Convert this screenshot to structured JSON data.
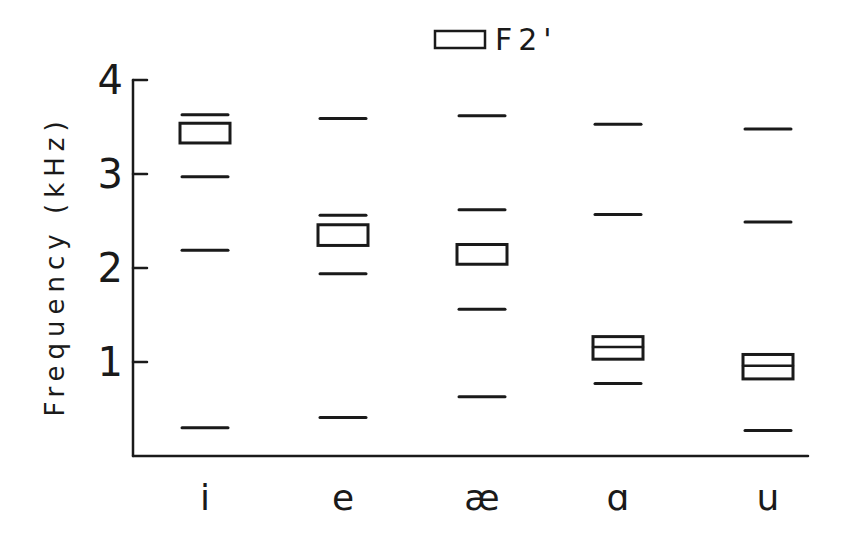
{
  "chart_data": {
    "type": "scatter",
    "title": "",
    "xlabel": "",
    "ylabel": "Frequency (kHz)",
    "ylim": [
      0,
      4
    ],
    "yticks": [
      "1",
      "2",
      "3",
      "4"
    ],
    "grid": false,
    "legend": {
      "position": "top-center",
      "entries": [
        {
          "symbol": "box",
          "label": "F2'"
        }
      ]
    },
    "categories": [
      "i",
      "e",
      "æ",
      "ɑ",
      "u"
    ],
    "series": [
      {
        "name": "formant-lines",
        "marker": "dash",
        "values": [
          [
            0.3,
            2.19,
            2.97,
            3.63
          ],
          [
            0.41,
            1.94,
            2.56,
            3.59
          ],
          [
            0.63,
            1.56,
            2.62,
            3.62
          ],
          [
            0.77,
            2.57,
            3.53
          ],
          [
            0.27,
            2.49,
            3.48
          ]
        ]
      },
      {
        "name": "F2'",
        "marker": "box",
        "ranges": [
          {
            "low": 3.33,
            "high": 3.54,
            "divider": null
          },
          {
            "low": 2.24,
            "high": 2.46,
            "divider": null
          },
          {
            "low": 2.04,
            "high": 2.25,
            "divider": null
          },
          {
            "low": 1.03,
            "high": 1.27,
            "divider": 1.16
          },
          {
            "low": 0.82,
            "high": 1.08,
            "divider": 0.96
          }
        ]
      }
    ]
  }
}
